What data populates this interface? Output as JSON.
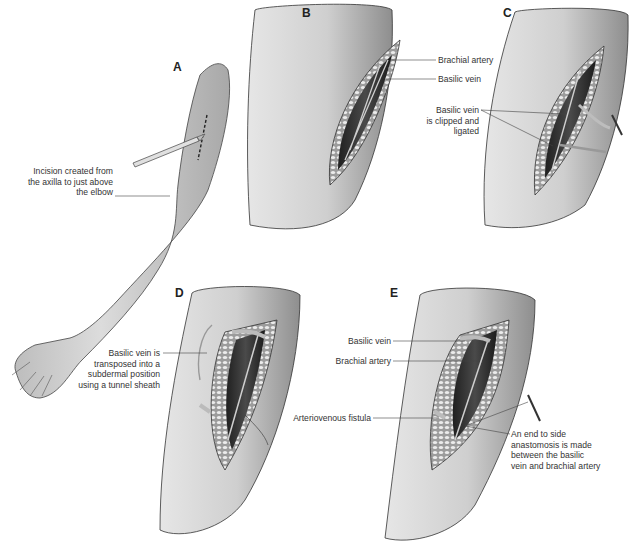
{
  "figure": {
    "type": "surgical illustration",
    "panels": [
      {
        "id": "A",
        "letter": "A",
        "labels": [
          {
            "text_lines": [
              "Incision created from",
              "the axilla to just above",
              "the elbow"
            ]
          }
        ]
      },
      {
        "id": "B",
        "letter": "B",
        "labels": [
          {
            "text_lines": [
              "Brachial artery"
            ]
          },
          {
            "text_lines": [
              "Basilic vein"
            ]
          }
        ]
      },
      {
        "id": "C",
        "letter": "C",
        "labels": [
          {
            "text_lines": [
              "Basilic vein",
              "is clipped and",
              "ligated"
            ]
          }
        ]
      },
      {
        "id": "D",
        "letter": "D",
        "labels": [
          {
            "text_lines": [
              "Basilic vein is",
              "transposed into a",
              "subdermal position",
              "using a tunnel sheath"
            ]
          }
        ]
      },
      {
        "id": "E",
        "letter": "E",
        "labels": [
          {
            "text_lines": [
              "Basilic vein"
            ]
          },
          {
            "text_lines": [
              "Brachial artery"
            ]
          },
          {
            "text_lines": [
              "Arteriovenous fistula"
            ]
          },
          {
            "text_lines": [
              "An end to side",
              "anastomosis is made",
              "between the basilic",
              "vein and brachial artery"
            ]
          }
        ]
      }
    ],
    "colors": {
      "skin": "#d4d4d4",
      "skin_shadow": "#9a9a9a",
      "outline": "#2a2a2a",
      "fat_tissue": "#b8b8b8",
      "wound_cavity": "#3a3a3a",
      "label_text": "#333333"
    }
  }
}
